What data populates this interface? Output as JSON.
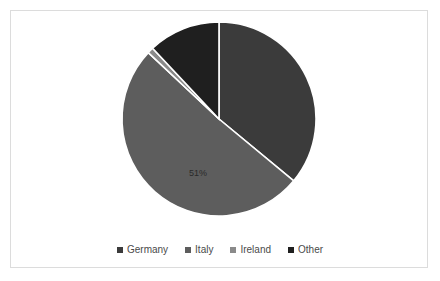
{
  "chart_data": {
    "type": "pie",
    "title": "",
    "categories": [
      "Germany",
      "Italy",
      "Ireland",
      "Other"
    ],
    "values": [
      36,
      51,
      1,
      12
    ],
    "labels": [
      "",
      "51%",
      "",
      ""
    ],
    "colors": [
      "#3b3b3b",
      "#5d5d5d",
      "#8a8a8a",
      "#1f1f1f"
    ],
    "slice_border_color": "#ffffff",
    "start_angle": 0,
    "direction": "clockwise",
    "grid": false,
    "legend_position": "bottom",
    "legend": [
      "Germany",
      "Italy",
      "Ireland",
      "Other"
    ],
    "visible_data_labels": [
      {
        "category": "Italy",
        "text": "51%",
        "x": 70,
        "y": 157
      }
    ]
  },
  "frame": {
    "border_color": "#dcdcdc",
    "background": "#ffffff"
  },
  "legend": {
    "items": [
      {
        "label": "Germany",
        "color": "#3b3b3b"
      },
      {
        "label": "Italy",
        "color": "#5d5d5d"
      },
      {
        "label": "Ireland",
        "color": "#8a8a8a"
      },
      {
        "label": "Other",
        "color": "#1f1f1f"
      }
    ]
  }
}
